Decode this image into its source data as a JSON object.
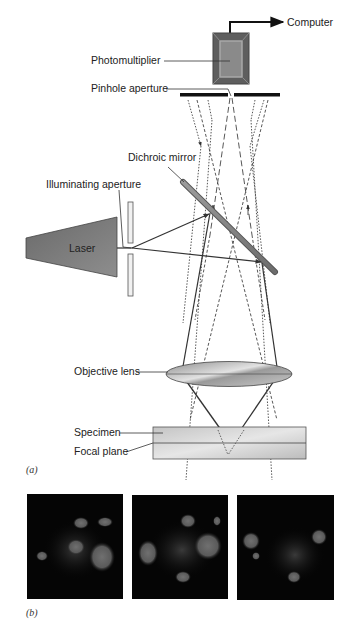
{
  "diagram": {
    "panel_a": {
      "caption": "(a)",
      "labels": {
        "computer": "Computer",
        "photomultiplier": "Photomultiplier",
        "pinhole_aperture": "Pinhole aperture",
        "dichroic_mirror": "Dichroic mirror",
        "illuminating_aperture": "Illuminating aperture",
        "laser": "Laser",
        "objective_lens": "Objective lens",
        "specimen": "Specimen",
        "focal_plane": "Focal plane"
      }
    },
    "panel_b": {
      "caption": "(b)",
      "images": [
        {
          "name": "optical-section-1"
        },
        {
          "name": "optical-section-2"
        },
        {
          "name": "optical-section-3"
        }
      ]
    },
    "colors": {
      "line": "#333333",
      "laser_fill": "#7a7a7a",
      "photomultiplier_fill": "#6e6e6e",
      "lens_fill": "#b0b0b0",
      "specimen_fill": "#cfcfcf",
      "micrograph_bg": "#050505",
      "micrograph_blob": "#6a6a6a"
    }
  }
}
